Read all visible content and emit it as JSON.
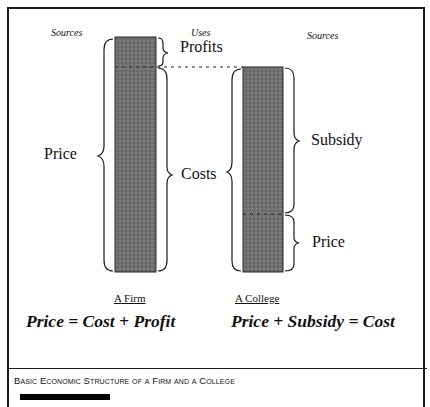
{
  "diagram": {
    "headers": {
      "firm_sources": "Sources",
      "uses": "Uses",
      "college_sources": "Sources"
    },
    "firm": {
      "title": "A Firm",
      "left_label": "Price",
      "right_labels": {
        "top": "Profits",
        "bottom": "Costs"
      },
      "equation": "Price = Cost + Profit"
    },
    "college": {
      "title": "A College",
      "right_labels": {
        "top": "Subsidy",
        "bottom": "Price"
      },
      "equation": "Price + Subsidy = Cost"
    },
    "colors": {
      "bar_fill": "#6e6e6e",
      "line": "#1a1a1a"
    }
  },
  "caption": {
    "text": "Basic Economic Structure of a Firm and a College"
  }
}
